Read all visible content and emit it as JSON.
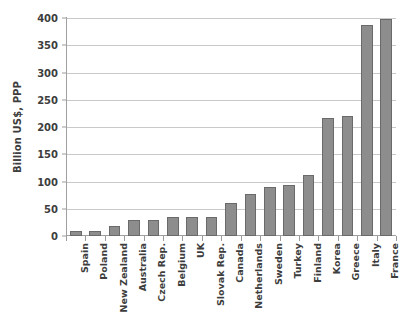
{
  "chart_data": {
    "type": "bar",
    "title": "",
    "xlabel": "",
    "ylabel": "Billion US$, PPP",
    "ylim": [
      0,
      400
    ],
    "ytick_step": 50,
    "yticks": [
      0,
      50,
      100,
      150,
      200,
      250,
      300,
      350,
      400
    ],
    "grid": true,
    "legend": false,
    "bar_color": "#8d8d8d",
    "bar_edge_color": "#6a6a6a",
    "categories": [
      "Spain",
      "Poland",
      "New Zealand",
      "Australia",
      "Czech Rep.",
      "Belgium",
      "UK",
      "Slovak Rep.",
      "Canada",
      "Netherlands",
      "Sweden",
      "Turkey",
      "Finland",
      "Korea",
      "Greece",
      "Italy",
      "France"
    ],
    "values": [
      10,
      10,
      18,
      29,
      29,
      34,
      34,
      35,
      60,
      77,
      90,
      93,
      112,
      217,
      221,
      388,
      398
    ]
  }
}
